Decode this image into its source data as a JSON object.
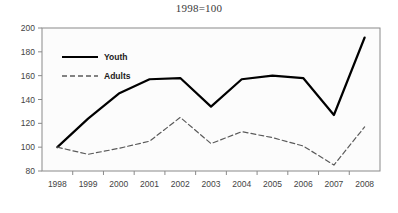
{
  "chart_data": {
    "type": "line",
    "title": "1998=100",
    "xlabel": "",
    "ylabel": "",
    "x": [
      1998,
      1999,
      2000,
      2001,
      2002,
      2003,
      2004,
      2005,
      2006,
      2007,
      2008
    ],
    "xtick_labels": [
      "1998",
      "1999",
      "2000",
      "2001",
      "2002",
      "2003",
      "2004",
      "2005",
      "2006",
      "2007",
      "2008"
    ],
    "ytick_labels": [
      "80",
      "100",
      "120",
      "140",
      "160",
      "180",
      "200"
    ],
    "yticks": [
      80,
      100,
      120,
      140,
      160,
      180,
      200
    ],
    "ylim": [
      80,
      200
    ],
    "grid": false,
    "legend_position": "upper-left-inside",
    "series": [
      {
        "name": "Youth",
        "style": "solid",
        "color": "#000000",
        "width": 2.2,
        "values": [
          100,
          124,
          145,
          157,
          158,
          134,
          157,
          160,
          158,
          127,
          192
        ]
      },
      {
        "name": "Adults",
        "style": "dashed",
        "color": "#5a5a5a",
        "width": 1.2,
        "values": [
          100,
          94,
          99,
          105,
          125,
          103,
          113,
          108,
          101,
          85,
          117
        ]
      }
    ]
  },
  "legend": {
    "items": [
      {
        "label": "Youth"
      },
      {
        "label": "Adults"
      }
    ]
  },
  "colors": {
    "youth_line": "#000000",
    "adults_line": "#5a5a5a",
    "plot_border": "#808080",
    "plot_background": "#fcfcfc",
    "tick_text": "#444444",
    "title_text": "#3a3a3a"
  }
}
